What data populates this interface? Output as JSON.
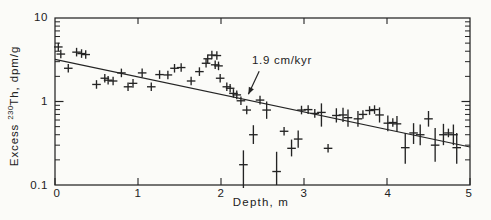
{
  "figure": {
    "background": "#fbfbf8",
    "ink_color": "#242424"
  },
  "chart_data": {
    "type": "scatter",
    "title": "",
    "xlabel": "Depth, m",
    "ylabel": "Excess 230Th, dpm/g",
    "ylabel_parts": {
      "prefix": "Excess ",
      "sup": "230",
      "suffix": "Th, dpm/g"
    },
    "marker": "plus",
    "grid": false,
    "x_axis": {
      "min": 0,
      "max": 5,
      "ticks": [
        0,
        1,
        2,
        3,
        4,
        5
      ],
      "tick_labels": [
        "0",
        "1",
        "2",
        "3",
        "4",
        "5"
      ]
    },
    "y_axis": {
      "scale": "log",
      "min": 0.1,
      "max": 10,
      "ticks": [
        10,
        1,
        0.1
      ],
      "tick_labels": [
        "10",
        "1",
        "0.1"
      ]
    },
    "fit_line": {
      "x": [
        0,
        5
      ],
      "y": [
        3.2,
        0.285
      ],
      "slope_label": "1.9 cm/kyr"
    },
    "annotation": {
      "text": "1.9 cm/kyr",
      "arrow_from": [
        2.46,
        2.3
      ],
      "arrow_to": [
        2.33,
        1.22
      ]
    },
    "points": [
      [
        0.04,
        4.5
      ],
      [
        0.07,
        3.7
      ],
      [
        0.16,
        2.5
      ],
      [
        0.26,
        3.9
      ],
      [
        0.32,
        3.75
      ],
      [
        0.37,
        3.65
      ],
      [
        0.5,
        1.6
      ],
      [
        0.6,
        1.9
      ],
      [
        0.64,
        1.8
      ],
      [
        0.7,
        1.76
      ],
      [
        0.8,
        2.2
      ],
      [
        0.88,
        1.5
      ],
      [
        0.94,
        1.65
      ],
      [
        1.05,
        2.2
      ],
      [
        1.16,
        1.5
      ],
      [
        1.26,
        2.1
      ],
      [
        1.36,
        2.08
      ],
      [
        1.44,
        2.5
      ],
      [
        1.52,
        2.55
      ],
      [
        1.64,
        1.76
      ],
      [
        1.74,
        2.28
      ],
      [
        1.82,
        2.87
      ],
      [
        1.84,
        3.25
      ],
      [
        1.89,
        3.6
      ],
      [
        1.95,
        3.55
      ],
      [
        1.93,
        2.75
      ],
      [
        1.97,
        2.67
      ],
      [
        1.99,
        1.9
      ],
      [
        2.07,
        1.5
      ],
      [
        2.11,
        1.44
      ],
      [
        2.15,
        1.25
      ],
      [
        2.19,
        1.2
      ],
      [
        2.24,
        1.02
      ],
      [
        2.27,
        0.175,
        0.092,
        0.26
      ],
      [
        2.31,
        0.79
      ],
      [
        2.39,
        0.4,
        0.31,
        0.52
      ],
      [
        2.47,
        1.04
      ],
      [
        2.55,
        0.79,
        0.62,
        1.0
      ],
      [
        2.67,
        0.145,
        0.1,
        0.25
      ],
      [
        2.76,
        0.44
      ],
      [
        2.85,
        0.275,
        0.22,
        0.35
      ],
      [
        2.93,
        0.355,
        0.28,
        0.45
      ],
      [
        2.97,
        0.79
      ],
      [
        3.05,
        0.8
      ],
      [
        3.13,
        0.72
      ],
      [
        3.21,
        0.74,
        0.5,
        0.95
      ],
      [
        3.29,
        0.275
      ],
      [
        3.39,
        0.68,
        0.56,
        0.83
      ],
      [
        3.47,
        0.69,
        0.57,
        0.84
      ],
      [
        3.53,
        0.64,
        0.5,
        0.8
      ],
      [
        3.65,
        0.62,
        0.5,
        0.77
      ],
      [
        3.71,
        0.7
      ],
      [
        3.79,
        0.78
      ],
      [
        3.85,
        0.8
      ],
      [
        3.91,
        0.69,
        0.56,
        0.85
      ],
      [
        4.01,
        0.55,
        0.44,
        0.68
      ],
      [
        4.07,
        0.56
      ],
      [
        4.12,
        0.54,
        0.43,
        0.67
      ],
      [
        4.22,
        0.28,
        0.18,
        0.42
      ],
      [
        4.32,
        0.42,
        0.31,
        0.55
      ],
      [
        4.4,
        0.4,
        0.3,
        0.53
      ],
      [
        4.5,
        0.62,
        0.5,
        0.77
      ],
      [
        4.58,
        0.3,
        0.19,
        0.48
      ],
      [
        4.68,
        0.4,
        0.3,
        0.54
      ],
      [
        4.74,
        0.42
      ],
      [
        4.8,
        0.4,
        0.3,
        0.53
      ],
      [
        4.84,
        0.28,
        0.18,
        0.42
      ]
    ],
    "plot_box_px": {
      "left": 55,
      "right": 470,
      "top": 18,
      "bottom": 185
    }
  }
}
